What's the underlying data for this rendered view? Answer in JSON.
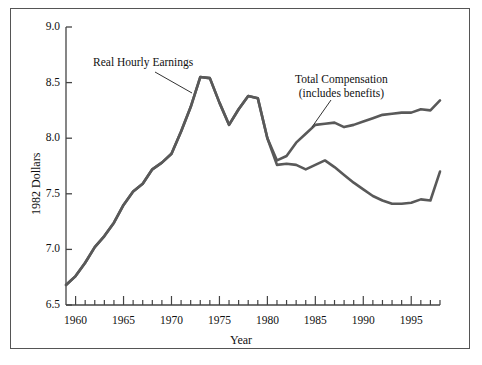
{
  "figure": {
    "background_color": "#ffffff",
    "frame_color": "#555555",
    "line_color": "#595959"
  },
  "chart_data": {
    "type": "line",
    "title": "",
    "xlabel": "Year",
    "ylabel": "1982 Dollars",
    "xlim": [
      1959,
      1998
    ],
    "ylim": [
      6.5,
      9.0
    ],
    "grid": false,
    "legend": "annotations-inline",
    "y_ticks": [
      "6.5",
      "7.0",
      "7.5",
      "8.0",
      "8.5",
      "9.0"
    ],
    "y_tick_values": [
      6.5,
      7.0,
      7.5,
      8.0,
      8.5,
      9.0
    ],
    "x_ticks": [
      "1960",
      "1965",
      "1970",
      "1975",
      "1980",
      "1985",
      "1990",
      "1995"
    ],
    "x_tick_values": [
      1960,
      1965,
      1970,
      1975,
      1980,
      1985,
      1990,
      1995
    ],
    "x_minor_step": 1,
    "annotations": [
      {
        "name": "real-hourly-earnings",
        "text": "Real Hourly Earnings",
        "lines": [
          "Real Hourly Earnings"
        ]
      },
      {
        "name": "total-compensation",
        "text": "Total Compensation (includes benefits)",
        "lines": [
          "Total Compensation",
          "(includes benefits)"
        ]
      }
    ],
    "x": [
      1959,
      1960,
      1961,
      1962,
      1963,
      1964,
      1965,
      1966,
      1967,
      1968,
      1969,
      1970,
      1971,
      1972,
      1973,
      1974,
      1975,
      1976,
      1977,
      1978,
      1979,
      1980,
      1981,
      1982,
      1983,
      1984,
      1985,
      1986,
      1987,
      1988,
      1989,
      1990,
      1991,
      1992,
      1993,
      1994,
      1995,
      1996,
      1997,
      1998
    ],
    "series": [
      {
        "name": "Real Hourly Earnings",
        "values": [
          6.68,
          6.76,
          6.88,
          7.02,
          7.12,
          7.24,
          7.4,
          7.52,
          7.59,
          7.72,
          7.78,
          7.86,
          8.06,
          8.28,
          8.55,
          8.54,
          8.32,
          8.12,
          8.26,
          8.38,
          8.36,
          8.0,
          7.76,
          7.77,
          7.76,
          7.72,
          7.76,
          7.8,
          7.74,
          7.67,
          7.6,
          7.54,
          7.48,
          7.44,
          7.41,
          7.41,
          7.42,
          7.45,
          7.44,
          7.7
        ]
      },
      {
        "name": "Total Compensation",
        "values": [
          6.68,
          6.76,
          6.88,
          7.02,
          7.12,
          7.24,
          7.4,
          7.52,
          7.59,
          7.72,
          7.78,
          7.86,
          8.06,
          8.28,
          8.55,
          8.54,
          8.32,
          8.12,
          8.26,
          8.38,
          8.36,
          8.0,
          7.8,
          7.84,
          7.96,
          8.04,
          8.12,
          8.13,
          8.14,
          8.1,
          8.12,
          8.15,
          8.18,
          8.21,
          8.22,
          8.23,
          8.23,
          8.26,
          8.25,
          8.34
        ]
      }
    ]
  },
  "axis": {
    "y_title": "1982 Dollars",
    "x_title": "Year"
  }
}
